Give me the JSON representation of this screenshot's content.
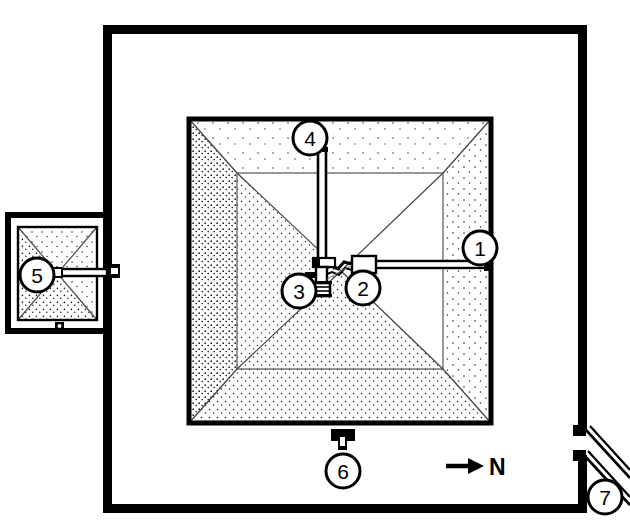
{
  "figure": {
    "kind": "archaeological-site-plan",
    "background_color": "#ffffff",
    "line_color": "#000000",
    "fill_color": "#ffffff",
    "stipple_color": "#1a1a1a"
  },
  "orientation": {
    "label": "N",
    "arrow_direction": "right",
    "arrow_glyph": "→"
  },
  "callouts": [
    {
      "id": "1",
      "label": "1",
      "cx": 480,
      "cy": 248,
      "r": 17,
      "anchor": "east-entrance-passage"
    },
    {
      "id": "2",
      "label": "2",
      "cx": 363,
      "cy": 288,
      "r": 17,
      "anchor": "antechamber"
    },
    {
      "id": "3",
      "label": "3",
      "cx": 299,
      "cy": 291,
      "r": 17,
      "anchor": "burial-chamber"
    },
    {
      "id": "4",
      "label": "4",
      "cx": 310,
      "cy": 138,
      "r": 17,
      "anchor": "north-vertical-shaft"
    },
    {
      "id": "5",
      "label": "5",
      "cx": 37,
      "cy": 275,
      "r": 17,
      "anchor": "satellite-pyramid"
    },
    {
      "id": "6",
      "label": "6",
      "cx": 343,
      "cy": 471,
      "r": 17,
      "anchor": "south-subsidiary-structure"
    },
    {
      "id": "7",
      "label": "7",
      "cx": 605,
      "cy": 497,
      "r": 17,
      "anchor": "causeway-gateway"
    }
  ],
  "structures": {
    "enclosure_wall": {
      "name": "enclosure-wall",
      "x": 103,
      "y": 25,
      "width": 484,
      "height": 488,
      "stroke_width": 8
    },
    "main_pyramid": {
      "name": "main-pyramid",
      "x": 186,
      "y": 116,
      "width": 308,
      "height": 310,
      "stroke_width": 5
    },
    "pyramid_inner_platform": {
      "name": "pyramid-inner-platform",
      "x": 237,
      "y": 173,
      "width": 206,
      "height": 196
    },
    "satellite_pyramid_enclosure": {
      "name": "satellite-pyramid-enclosure",
      "x": 8,
      "y": 215,
      "width": 98,
      "height": 116,
      "stroke_width": 6
    },
    "satellite_pyramid": {
      "name": "satellite-pyramid",
      "x": 17,
      "y": 227,
      "width": 80,
      "height": 93
    },
    "east_passage": {
      "name": "east-entrance-passage",
      "from_x": 488,
      "from_y": 265,
      "to_x": 377,
      "to_y": 265
    },
    "north_shaft": {
      "name": "north-vertical-shaft",
      "from_x": 322,
      "from_y": 148,
      "to_x": 322,
      "to_y": 268
    },
    "south_structure": {
      "name": "south-subsidiary-structure",
      "x": 331,
      "y": 430,
      "width": 24,
      "height": 20
    },
    "causeway": {
      "name": "causeway",
      "from_x": 586,
      "from_y": 430,
      "to_x": 630,
      "to_y": 480
    }
  }
}
